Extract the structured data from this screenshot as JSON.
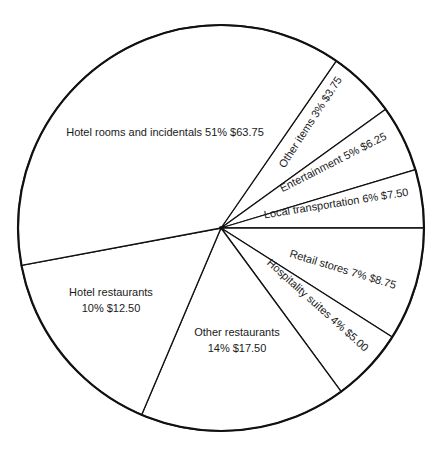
{
  "chart_data": {
    "type": "pie",
    "title": "",
    "center": [
      221,
      228
    ],
    "radius": 203,
    "start_angle_deg": -55.4,
    "colors": {
      "stroke": "#111111",
      "fill": "#ffffff",
      "text": "#1a1a1a"
    },
    "slices": [
      {
        "label": "Other items",
        "percent": 3,
        "value": 3.75,
        "text": "Other items 3% $3.75",
        "start_deg": -55.4,
        "end_deg": -35.8,
        "label_lines": [
          "Other items 3% $3.75"
        ],
        "label_pos": [
          310,
          122
        ],
        "label_rotate": -57
      },
      {
        "label": "Entertainment",
        "percent": 5,
        "value": 6.25,
        "text": "Entertainment 5% $6.25",
        "start_deg": -35.8,
        "end_deg": -16.7,
        "label_lines": [
          "Entertainment 5% $6.25"
        ],
        "label_pos": [
          333,
          162
        ],
        "label_rotate": -27
      },
      {
        "label": "Local transportation",
        "percent": 6,
        "value": 7.5,
        "text": "Local transportation 6% $7.50",
        "start_deg": -16.7,
        "end_deg": 0,
        "label_lines": [
          "Local transportation 6% $7.50"
        ],
        "label_pos": [
          336,
          203
        ],
        "label_rotate": -9
      },
      {
        "label": "Retail stores",
        "percent": 7,
        "value": 8.75,
        "text": "Retail stores 7% $8.75",
        "start_deg": 0,
        "end_deg": 32.5,
        "label_lines": [
          "Retail stores 7% $8.75"
        ],
        "label_pos": [
          343,
          269
        ],
        "label_rotate": 17
      },
      {
        "label": "Hospitality suites",
        "percent": 4,
        "value": 5.0,
        "text": "Hospitality suites 4% $5.00",
        "start_deg": 32.5,
        "end_deg": 53.7,
        "label_lines": [
          "Hospitality suites 4% $5.00"
        ],
        "label_pos": [
          318,
          305
        ],
        "label_rotate": 42
      },
      {
        "label": "Other restaurants",
        "percent": 14,
        "value": 17.5,
        "text": "Other restaurants 14% $17.50",
        "start_deg": 53.7,
        "end_deg": 113,
        "label_lines": [
          "Other restaurants",
          "14% $17.50"
        ],
        "label_pos": [
          237,
          340
        ],
        "label_rotate": 0
      },
      {
        "label": "Hotel restaurants",
        "percent": 10,
        "value": 12.5,
        "text": "Hotel restaurants 10% $12.50",
        "start_deg": 113,
        "end_deg": 169.4,
        "label_lines": [
          "Hotel restaurants",
          "10% $12.50"
        ],
        "label_pos": [
          111,
          300
        ],
        "label_rotate": 0
      },
      {
        "label": "Hotel rooms and incidentals",
        "percent": 51,
        "value": 63.75,
        "text": "Hotel rooms and incidentals 51% $63.75",
        "start_deg": 169.4,
        "end_deg": 304.6,
        "label_lines": [
          "Hotel rooms and incidentals 51% $63.75"
        ],
        "label_pos": [
          165,
          132
        ],
        "label_rotate": 0
      }
    ],
    "categories": [
      "Hotel rooms and incidentals",
      "Hotel restaurants",
      "Other restaurants",
      "Hospitality suites",
      "Retail stores",
      "Local transportation",
      "Entertainment",
      "Other items"
    ],
    "values": [
      63.75,
      12.5,
      17.5,
      5.0,
      8.75,
      7.5,
      6.25,
      3.75
    ],
    "percents": [
      51,
      10,
      14,
      4,
      7,
      6,
      5,
      3
    ],
    "legend": "none (labels inside slices)"
  }
}
